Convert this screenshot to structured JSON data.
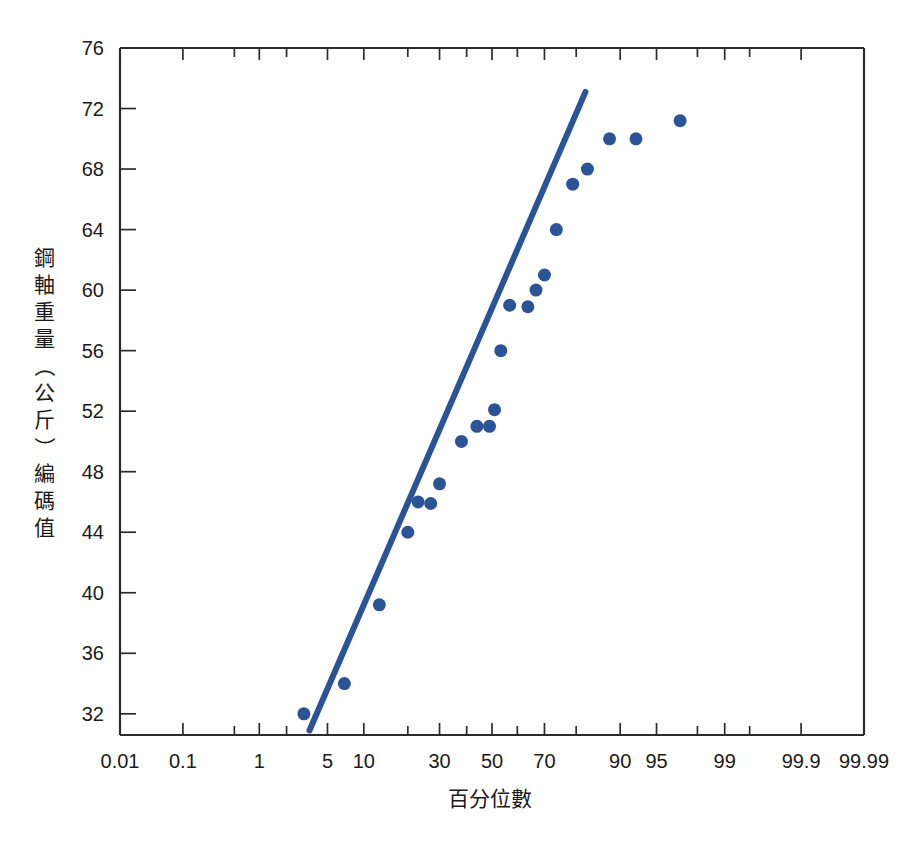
{
  "chart_data": {
    "type": "scatter",
    "title": "",
    "subtitle": "",
    "xlabel": "百分位數",
    "ylabel": "鋼軸重量（公斤）編碼值",
    "ylabel_chars": [
      "鋼",
      "軸",
      "重",
      "量",
      "（",
      "公",
      "斤",
      "）",
      "編",
      "碼",
      "值"
    ],
    "x_scale": "probit",
    "x_unit": "percentile",
    "y_unit": "kg",
    "xlim": [
      0.01,
      99.99
    ],
    "ylim": [
      30.6,
      76
    ],
    "grid": false,
    "legend": null,
    "legend_position": "none",
    "xticks": [
      0.01,
      0.1,
      1,
      5,
      10,
      30,
      50,
      70,
      90,
      95,
      99,
      99.9,
      99.99
    ],
    "xtick_labels": [
      "0.01",
      "0.1",
      "1",
      "5",
      "10",
      "30",
      "50",
      "70",
      "90",
      "95",
      "99",
      "99.9",
      "99.99"
    ],
    "xticks_minor": [
      0.5,
      2,
      20,
      40,
      60,
      80,
      98,
      99.5
    ],
    "yticks": [
      32,
      36,
      40,
      44,
      48,
      52,
      56,
      60,
      64,
      68,
      72,
      76
    ],
    "ytick_labels": [
      "32",
      "36",
      "40",
      "44",
      "48",
      "52",
      "56",
      "60",
      "64",
      "68",
      "72",
      "76"
    ],
    "series": [
      {
        "name": "鋼軸重量",
        "marker": "circle",
        "marker_color": "#2a5496",
        "marker_size": 13,
        "points": [
          {
            "x": 3.0,
            "y": 32.0
          },
          {
            "x": 7.0,
            "y": 34.0
          },
          {
            "x": 13.0,
            "y": 39.2
          },
          {
            "x": 20.0,
            "y": 44.0
          },
          {
            "x": 23.0,
            "y": 46.0
          },
          {
            "x": 27.0,
            "y": 45.9
          },
          {
            "x": 30.0,
            "y": 47.2
          },
          {
            "x": 38.0,
            "y": 50.0
          },
          {
            "x": 44.0,
            "y": 51.0
          },
          {
            "x": 49.0,
            "y": 51.0
          },
          {
            "x": 51.0,
            "y": 52.1
          },
          {
            "x": 53.5,
            "y": 56.0
          },
          {
            "x": 57.0,
            "y": 59.0
          },
          {
            "x": 64.0,
            "y": 58.9
          },
          {
            "x": 67.0,
            "y": 60.0
          },
          {
            "x": 70.0,
            "y": 61.0
          },
          {
            "x": 74.0,
            "y": 64.0
          },
          {
            "x": 79.0,
            "y": 67.0
          },
          {
            "x": 83.0,
            "y": 68.0
          },
          {
            "x": 88.0,
            "y": 70.0
          },
          {
            "x": 92.5,
            "y": 70.0
          },
          {
            "x": 97.0,
            "y": 71.2
          }
        ]
      }
    ],
    "fit_line": {
      "name": "reference-line",
      "color": "#2a5496",
      "width": 6,
      "start": {
        "x": 3.4,
        "y": 30.9
      },
      "end": {
        "x": 82.5,
        "y": 73.1
      }
    },
    "annotations": []
  },
  "figure": {
    "background": "#ffffff",
    "axis_color": "#2b2b2b",
    "accent_color": "#2a5496",
    "width": 920,
    "height": 850
  }
}
